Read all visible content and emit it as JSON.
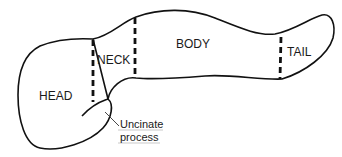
{
  "diagram": {
    "labels": {
      "head": "HEAD",
      "neck": "NECK",
      "body": "BODY",
      "tail": "TAIL",
      "uncinate_line1": "Uncinate",
      "uncinate_line2": "process"
    },
    "colors": {
      "stroke": "#111111",
      "background": "#ffffff"
    }
  }
}
